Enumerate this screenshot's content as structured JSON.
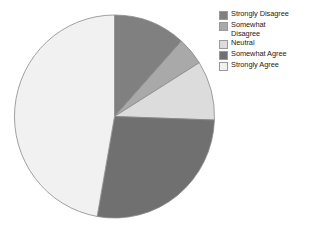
{
  "chart": {
    "type": "pie",
    "title": "",
    "subtitle": "",
    "legend_position": "right"
  },
  "chart_data": {
    "type": "pie",
    "title": "",
    "xlabel": "",
    "ylabel": "",
    "grid": false,
    "legend_position": "right",
    "labels": [
      "Strongly Disagree",
      "Somewhat Disagree",
      "Neutral",
      "Somewhat Agree",
      "Strongly Agree"
    ],
    "values": [
      11.7,
      4.4,
      9.4,
      27.2,
      47.3
    ],
    "start_angle_deg": 0,
    "direction": "clockwise",
    "boundary_angles_deg": [
      0,
      42,
      58,
      92,
      190,
      360
    ],
    "colors": [
      "#808080",
      "#a9a9a9",
      "#dcdcdc",
      "#707070",
      "#f1f1f1"
    ],
    "edge_color": "#8a8a8a"
  },
  "legend": {
    "items": [
      {
        "label": "Strongly Disagree",
        "color": "#808080"
      },
      {
        "label": "Somewhat\nDisagree",
        "color": "#a9a9a9"
      },
      {
        "label": "Neutral",
        "color": "#dcdcdc"
      },
      {
        "label": "Somewhat Agree",
        "color": "#707070"
      },
      {
        "label": "Strongly Agree",
        "color": "#f1f1f1"
      }
    ]
  }
}
